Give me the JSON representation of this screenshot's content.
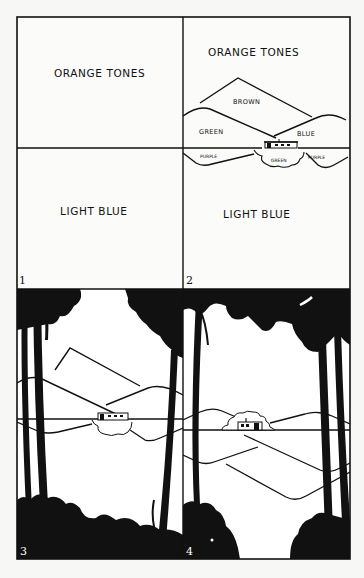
{
  "figure": {
    "panels": [
      {
        "number": "1",
        "labels": {
          "sky": "ORANGE TONES",
          "water": "LIGHT BLUE"
        }
      },
      {
        "number": "2",
        "labels": {
          "sky": "ORANGE TONES",
          "back_mountain": "BROWN",
          "left_hill": "GREEN",
          "right_hill": "BLUE",
          "left_reflection": "PURPLE",
          "center_reflection": "GREEN",
          "right_reflection": "PURPLE",
          "water": "LIGHT BLUE"
        }
      },
      {
        "number": "3"
      },
      {
        "number": "4"
      }
    ],
    "colors": {
      "ink": "#111111",
      "paper": "#f7f7f5"
    }
  }
}
